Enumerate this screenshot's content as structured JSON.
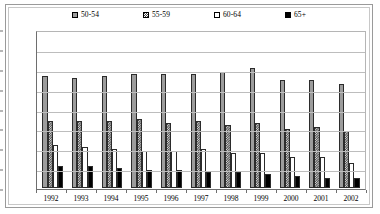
{
  "chart_data": {
    "type": "bar",
    "title": "",
    "xlabel": "",
    "ylabel": "",
    "ylim": [
      0,
      80
    ],
    "yticks": [
      0,
      10,
      20,
      30,
      40,
      50,
      60,
      70,
      80
    ],
    "grid": true,
    "legend_position": "top",
    "categories": [
      "1992",
      "1993",
      "1994",
      "1995",
      "1996",
      "1997",
      "1998",
      "1999",
      "2000",
      "2001",
      "2002"
    ],
    "series": [
      {
        "name": "50-54",
        "marker": "light-gray-square",
        "color": "#9c9c9c",
        "values": [
          57,
          56,
          57,
          58,
          58,
          58,
          59,
          61,
          55,
          55,
          53
        ]
      },
      {
        "name": "55-59",
        "marker": "checkered-dark-square",
        "color": "#4f4f4f",
        "values": [
          34,
          34,
          34,
          35,
          33,
          34,
          32,
          33,
          30,
          31,
          29
        ]
      },
      {
        "name": "60-64",
        "marker": "white-open-square",
        "color": "#ffffff",
        "values": [
          22,
          21,
          20,
          19,
          19,
          20,
          18,
          18,
          16,
          16,
          13
        ]
      },
      {
        "name": "65+",
        "marker": "black-filled-square",
        "color": "#000000",
        "values": [
          11,
          11,
          10,
          9,
          9,
          8,
          8,
          7,
          6,
          5,
          5
        ]
      }
    ]
  },
  "legend": {
    "items": [
      {
        "label": "50-54"
      },
      {
        "label": "55-59"
      },
      {
        "label": "60-64"
      },
      {
        "label": "65+"
      }
    ]
  }
}
